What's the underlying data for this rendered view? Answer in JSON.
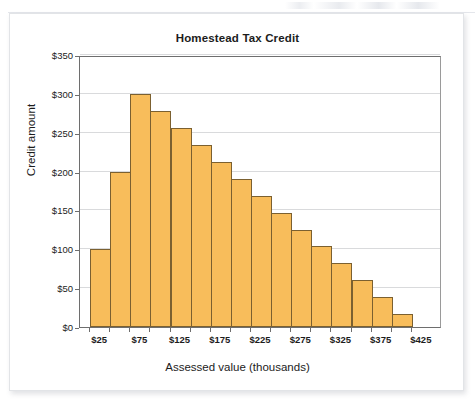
{
  "figure": {
    "title": "Homestead Tax Credit"
  },
  "chart_data": {
    "type": "bar",
    "title": "Homestead Tax Credit",
    "xlabel": "Assessed value (thousands)",
    "ylabel": "Credit amount",
    "grid": true,
    "legend": "none",
    "bar_color": "#f8bd5b",
    "bar_edge_color": "#7b6030",
    "xlim": [
      0,
      450
    ],
    "ylim": [
      0,
      350
    ],
    "bin_width": 25,
    "categories": [
      "$25",
      "$50",
      "$75",
      "$100",
      "$125",
      "$150",
      "$175",
      "$200",
      "$225",
      "$250",
      "$275",
      "$300",
      "$325",
      "$350",
      "$375",
      "$400"
    ],
    "values": [
      100,
      200,
      300,
      278,
      256,
      234,
      212,
      190,
      168,
      147,
      125,
      104,
      82,
      60,
      39,
      17
    ],
    "bar_labels": [
      "$100",
      "$200",
      "$300",
      "$278",
      "$256",
      "$234",
      "$212",
      "$190",
      "$168",
      "$147",
      "$125",
      "$104",
      "$82",
      "$60",
      "$39",
      "$17"
    ],
    "yticks": [
      0,
      50,
      100,
      150,
      200,
      250,
      300,
      350
    ],
    "ytick_labels": [
      "$0",
      "$50",
      "$100",
      "$150",
      "$200",
      "$250",
      "$300",
      "$350"
    ],
    "xticks": [
      25,
      75,
      125,
      175,
      225,
      275,
      325,
      375,
      425
    ],
    "xtick_labels": [
      "$25",
      "$75",
      "$125",
      "$175",
      "$225",
      "$275",
      "$325",
      "$375",
      "$425"
    ]
  }
}
